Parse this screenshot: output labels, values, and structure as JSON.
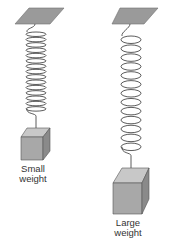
{
  "figure": {
    "colors": {
      "plate": "#9a9a9a",
      "plate_edge": "#6e6e6e",
      "spring": "#4a4a4a",
      "box_top": "#c8c8c8",
      "box_front": "#a8a8a8",
      "box_side": "#8a8a8a",
      "box_edge": "#555555",
      "text": "#333333"
    },
    "left": {
      "label_line1": "Small",
      "label_line2": "weight",
      "coils": 15
    },
    "right": {
      "label_line1": "Large",
      "label_line2": "weight",
      "coils": 13
    }
  }
}
